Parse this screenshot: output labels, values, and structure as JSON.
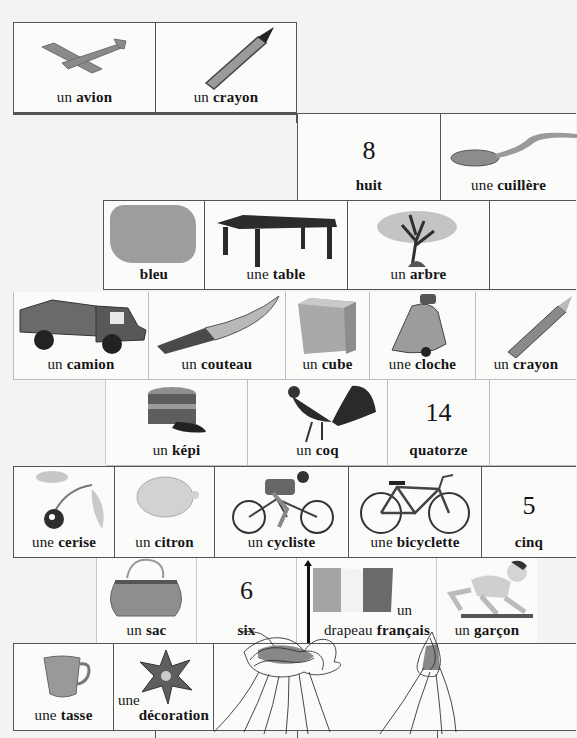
{
  "page": {
    "palette": {
      "paper": "#f3f3f2",
      "card": "#fbfbfa",
      "ink": "#151515",
      "grid": "#555555",
      "scribble": "#2a2a2a"
    }
  },
  "rows": [
    {
      "cards": [
        {
          "id": "avion",
          "article": "un",
          "word": "avion",
          "icon": "airplane-icon"
        },
        {
          "id": "crayon1",
          "article": "un",
          "word": "crayon",
          "icon": "pencil-icon"
        }
      ]
    },
    {
      "cards": [
        {
          "id": "huit",
          "numeral": "8",
          "word": "huit",
          "icon": "number-icon"
        },
        {
          "id": "cuillere",
          "article": "une",
          "word": "cuillère",
          "icon": "spoon-icon"
        }
      ]
    },
    {
      "cards": [
        {
          "id": "bleu",
          "article": "",
          "word": "bleu",
          "icon": "blue-swatch-icon"
        },
        {
          "id": "table",
          "article": "une",
          "word": "table",
          "icon": "table-icon"
        },
        {
          "id": "arbre",
          "article": "un",
          "word": "arbre",
          "icon": "tree-icon"
        },
        {
          "id": "blank1",
          "article": "",
          "word": "",
          "icon": ""
        }
      ]
    },
    {
      "cards": [
        {
          "id": "camion",
          "article": "un",
          "word": "camion",
          "icon": "truck-icon"
        },
        {
          "id": "couteau",
          "article": "un",
          "word": "couteau",
          "icon": "knife-icon"
        },
        {
          "id": "cube",
          "article": "un",
          "word": "cube",
          "icon": "cube-icon"
        },
        {
          "id": "cloche",
          "article": "une",
          "word": "cloche",
          "icon": "bell-icon"
        },
        {
          "id": "crayon2",
          "article": "un",
          "word": "crayon",
          "icon": "pencil-icon"
        }
      ]
    },
    {
      "cards": [
        {
          "id": "kepi",
          "article": "un",
          "word": "képi",
          "icon": "kepi-cap-icon"
        },
        {
          "id": "coq",
          "article": "un",
          "word": "coq",
          "icon": "rooster-icon"
        },
        {
          "id": "quatorze",
          "numeral": "14",
          "word": "quatorze",
          "icon": "number-icon"
        },
        {
          "id": "blank2",
          "article": "",
          "word": "",
          "icon": ""
        }
      ]
    },
    {
      "cards": [
        {
          "id": "cerise",
          "article": "une",
          "word": "cerise",
          "icon": "cherry-icon"
        },
        {
          "id": "citron",
          "article": "un",
          "word": "citron",
          "icon": "lemon-icon"
        },
        {
          "id": "cycliste",
          "article": "un",
          "word": "cycliste",
          "icon": "cyclist-icon"
        },
        {
          "id": "bicyclette",
          "article": "une",
          "word": "bicyclette",
          "icon": "bicycle-icon"
        },
        {
          "id": "cinq",
          "numeral": "5",
          "word": "cinq",
          "icon": "number-icon"
        }
      ]
    },
    {
      "cards": [
        {
          "id": "sac",
          "article": "un",
          "word": "sac",
          "icon": "handbag-icon"
        },
        {
          "id": "six",
          "numeral": "6",
          "word": "six",
          "icon": "number-icon"
        },
        {
          "id": "drapeau",
          "article": "un",
          "word": "drapeau",
          "adjective": "français",
          "icon": "french-flag-icon"
        },
        {
          "id": "garcon",
          "article": "un",
          "word": "garçon",
          "icon": "boy-crawling-icon"
        }
      ]
    },
    {
      "cards": [
        {
          "id": "tasse",
          "article": "une",
          "word": "tasse",
          "icon": "teacup-icon"
        },
        {
          "id": "decoration",
          "article": "une",
          "word": "décoration",
          "icon": "medal-cross-icon"
        },
        {
          "id": "scribble",
          "article": "",
          "word": "",
          "icon": "pen-scribble-icon"
        }
      ]
    }
  ]
}
